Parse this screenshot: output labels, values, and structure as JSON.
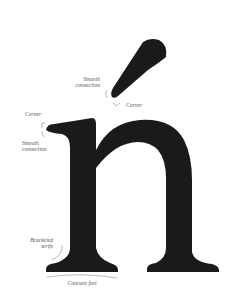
{
  "figure": {
    "glyph_color": "#1a1a1a",
    "annotation_color": "#555555",
    "leader_color": "#999999"
  },
  "labels": {
    "accent_smooth": {
      "line1": "Smooth",
      "line2": "connection"
    },
    "accent_corner": "Corner",
    "serif_corner": "Corner",
    "serif_smooth": {
      "line1": "Smooth",
      "line2": "connection"
    },
    "bracketed": {
      "line1": "Bracketed",
      "line2": "serifs"
    },
    "concave": "Concave feet"
  }
}
